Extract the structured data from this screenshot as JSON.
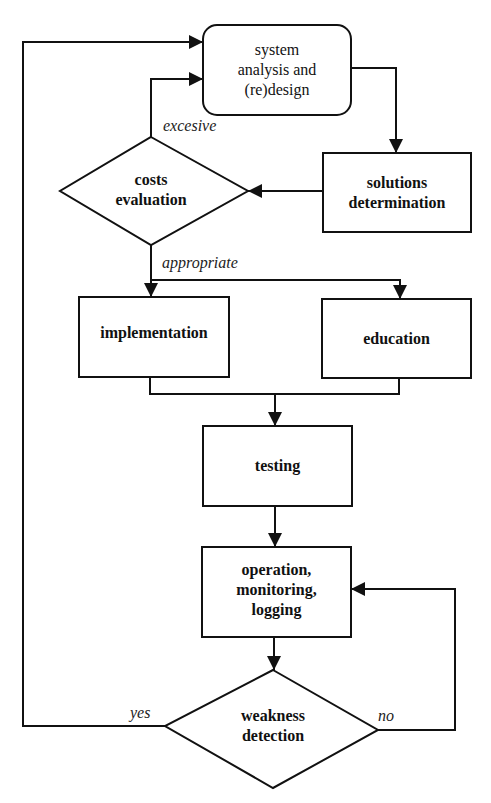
{
  "diagram": {
    "type": "flowchart",
    "colors": {
      "stroke": "#111111",
      "background": "#ffffff",
      "text": "#111111"
    },
    "nodes": [
      {
        "id": "system",
        "shape": "rounded-rect",
        "lines": [
          "system",
          "analysis and",
          "(re)design"
        ]
      },
      {
        "id": "solutions",
        "shape": "rect",
        "lines": [
          "solutions",
          "determination"
        ]
      },
      {
        "id": "costs",
        "shape": "diamond",
        "lines": [
          "costs",
          "evaluation"
        ]
      },
      {
        "id": "implementation",
        "shape": "rect",
        "lines": [
          "implementation"
        ]
      },
      {
        "id": "education",
        "shape": "rect",
        "lines": [
          "education"
        ]
      },
      {
        "id": "testing",
        "shape": "rect",
        "lines": [
          "testing"
        ]
      },
      {
        "id": "operation",
        "shape": "rect",
        "lines": [
          "operation,",
          "monitoring,",
          "logging"
        ]
      },
      {
        "id": "weakness",
        "shape": "diamond",
        "lines": [
          "weakness",
          "detection"
        ]
      }
    ],
    "edge_labels": {
      "excesive": "excesive",
      "appropriate": "appropriate",
      "yes": "yes",
      "no": "no"
    },
    "edges": [
      {
        "from": "system",
        "to": "solutions"
      },
      {
        "from": "solutions",
        "to": "costs"
      },
      {
        "from": "costs",
        "to": "system",
        "label": "excesive"
      },
      {
        "from": "costs",
        "to": "implementation",
        "label": "appropriate"
      },
      {
        "from": "costs",
        "to": "education",
        "label": "appropriate"
      },
      {
        "from": "implementation",
        "to": "testing"
      },
      {
        "from": "education",
        "to": "testing"
      },
      {
        "from": "testing",
        "to": "operation"
      },
      {
        "from": "operation",
        "to": "weakness"
      },
      {
        "from": "weakness",
        "to": "system",
        "label": "yes"
      },
      {
        "from": "weakness",
        "to": "operation",
        "label": "no"
      }
    ]
  }
}
